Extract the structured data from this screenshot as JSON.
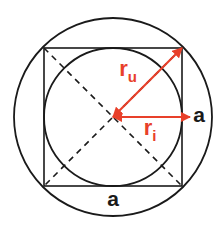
{
  "figure": {
    "background_color": "#ffffff",
    "stroke_color": "#1a1a1a",
    "accent_color": "#e8402a",
    "label_color_black": "#1a1a1a",
    "width": 221,
    "height": 230
  },
  "geometry": {
    "center": {
      "x": 113,
      "y": 117
    },
    "outer_circle": {
      "cx": 113,
      "cy": 117,
      "r": 99,
      "name": "circumscribed-circle"
    },
    "inner_circle": {
      "cx": 113,
      "cy": 117,
      "r": 69,
      "name": "inscribed-circle"
    },
    "square": {
      "x": 44,
      "y": 48,
      "size": 138,
      "name": "square"
    },
    "diagonals": [
      {
        "x1": 44,
        "y1": 48,
        "x2": 182,
        "y2": 186
      },
      {
        "x1": 182,
        "y1": 48,
        "x2": 44,
        "y2": 186
      }
    ],
    "radius_outer_arrow": {
      "x1": 113,
      "y1": 117,
      "x2": 182,
      "y2": 48
    },
    "radius_inner_arrow": {
      "x1": 113,
      "y1": 117,
      "x2": 190,
      "y2": 117
    }
  },
  "labels": {
    "r_u": {
      "base": "r",
      "sub": "u",
      "x": 128,
      "y": 76,
      "color": "#e8402a"
    },
    "r_i": {
      "base": "r",
      "sub": "i",
      "x": 150,
      "y": 135,
      "color": "#e8402a"
    },
    "a_right": {
      "text": "a",
      "x": 199,
      "y": 122,
      "color": "#1a1a1a"
    },
    "a_bottom": {
      "text": "a",
      "x": 113,
      "y": 206,
      "color": "#1a1a1a"
    }
  }
}
